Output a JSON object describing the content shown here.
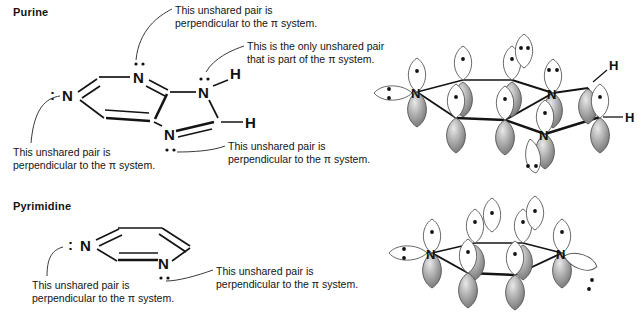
{
  "figure": {
    "kind": "chemical-structure-diagram",
    "background_color": "#ffffff",
    "line_color": "#141414",
    "orbital_up_color": "#ffffff",
    "orbital_down_color": "#8c8c8c"
  },
  "sections": {
    "purine": {
      "title": "Purine",
      "skeletal_atoms": [
        "N",
        "N",
        "N",
        "N",
        "H",
        "H"
      ],
      "orbital_atoms": [
        "N",
        "N",
        "N",
        "H",
        "H"
      ]
    },
    "pyrimidine": {
      "title": "Pyrimidine",
      "skeletal_atoms": [
        "N",
        "N"
      ],
      "orbital_atoms": [
        "N",
        "N"
      ]
    }
  },
  "annotations": {
    "purine_top": {
      "line1": "This unshared pair is",
      "line2": "perpendicular to the π system."
    },
    "purine_pi": {
      "line1": "This is the only unshared pair",
      "line2": "that is part of the π system."
    },
    "purine_left": {
      "line1": "This unshared pair is",
      "line2": "perpendicular to the π system."
    },
    "purine_bottom": {
      "line1": "This unshared pair is",
      "line2": "perpendicular to the π system."
    },
    "pyrimidine_left": {
      "line1": "This unshared pair is",
      "line2": "perpendicular to the π system."
    },
    "pyrimidine_right": {
      "line1": "This unshared pair is",
      "line2": "perpendicular to the π system."
    }
  },
  "atom_labels": {
    "n": "N",
    "h": "H",
    "lone_pair_colon": ":"
  }
}
